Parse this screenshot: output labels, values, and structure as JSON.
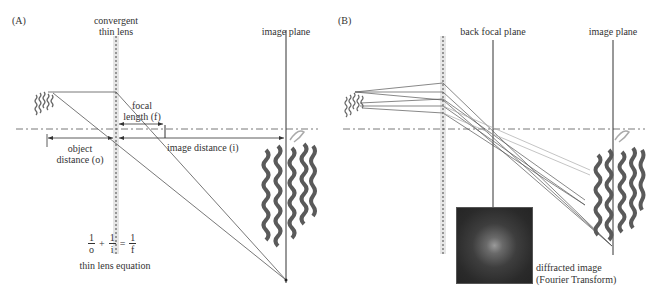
{
  "panels": [
    {
      "id": "A",
      "label": "(A)",
      "lens_label_line1": "convergent",
      "lens_label_line2": "thin lens",
      "image_plane_label": "image plane",
      "focal_label_line1": "focal",
      "focal_label_line2": "length (f)",
      "object_label_line1": "object",
      "object_label_line2": "distance (o)",
      "image_distance_label": "image distance (i)",
      "equation": {
        "term1_num": "1",
        "term1_den": "o",
        "plus": "+",
        "term2_num": "1",
        "term2_den": "i",
        "equals": "=",
        "term3_num": "1",
        "term3_den": "f",
        "caption": "thin lens equation"
      }
    },
    {
      "id": "B",
      "label": "(B)",
      "back_focal_label": "back focal plane",
      "image_plane_label": "image plane",
      "diffracted_label_line1": "diffracted image",
      "diffracted_label_line2": "(Fourier Transform)"
    }
  ],
  "colors": {
    "line": "#444444",
    "ray": "#555555",
    "lens_band": "#e4e4e4",
    "protein": "#5a5a5a",
    "axis": "#555555"
  }
}
